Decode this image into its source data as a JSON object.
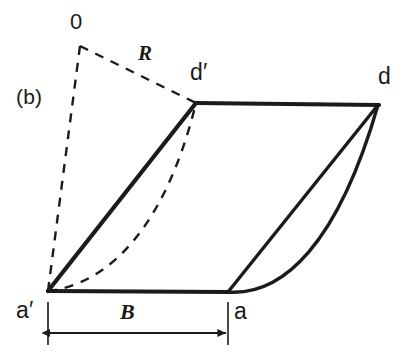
{
  "figure": {
    "panel_label": "(b)",
    "background_color": "#ffffff",
    "ink_color": "#1b1b1b",
    "width": 411,
    "height": 352
  },
  "labels": {
    "origin": "0",
    "radius": "R",
    "corner_d_prime": "d′",
    "corner_d": "d",
    "corner_a_prime": "a′",
    "corner_a": "a",
    "dimension_b": "B"
  },
  "geometry": {
    "points": {
      "O": {
        "x": 80,
        "y": 46,
        "name": "origin-0"
      },
      "d_prime": {
        "x": 196,
        "y": 103,
        "name": "corner-d-prime"
      },
      "d": {
        "x": 378,
        "y": 105,
        "name": "corner-d"
      },
      "a_prime": {
        "x": 48,
        "y": 291,
        "name": "corner-a-prime"
      },
      "a": {
        "x": 228,
        "y": 292,
        "name": "corner-a"
      }
    },
    "solid_edges": [
      {
        "from": "a_prime",
        "to": "d_prime",
        "style": "straight",
        "name": "edge-left"
      },
      {
        "from": "d_prime",
        "to": "d",
        "style": "straight",
        "name": "edge-top"
      },
      {
        "from": "a_prime",
        "to": "a",
        "style": "straight",
        "name": "edge-bottom"
      },
      {
        "from": "a",
        "to": "d",
        "style": "straight",
        "name": "edge-right-chord"
      },
      {
        "from": "a",
        "to": "d",
        "style": "curved",
        "name": "edge-right-arc"
      }
    ],
    "dashed_edges": [
      {
        "from": "O",
        "to": "a_prime",
        "style": "straight",
        "name": "radius-line-to-a-prime"
      },
      {
        "from": "O",
        "to": "d_prime",
        "style": "straight",
        "name": "radius-line-R"
      },
      {
        "from": "a_prime",
        "to": "d_prime",
        "style": "curved",
        "name": "inner-arc-dashed"
      }
    ],
    "dimension": {
      "label": "B",
      "from_x": 48,
      "to_x": 228,
      "y": 333,
      "name": "dimension-b"
    }
  },
  "label_positions": {
    "panel": {
      "x": 16,
      "y": 86
    },
    "origin": {
      "x": 70,
      "y": 11
    },
    "radius": {
      "x": 138,
      "y": 43
    },
    "d_prime": {
      "x": 190,
      "y": 61
    },
    "d": {
      "x": 378,
      "y": 65
    },
    "a_prime": {
      "x": 16,
      "y": 299
    },
    "a": {
      "x": 234,
      "y": 300
    },
    "dimension_b": {
      "x": 120,
      "y": 301
    }
  }
}
